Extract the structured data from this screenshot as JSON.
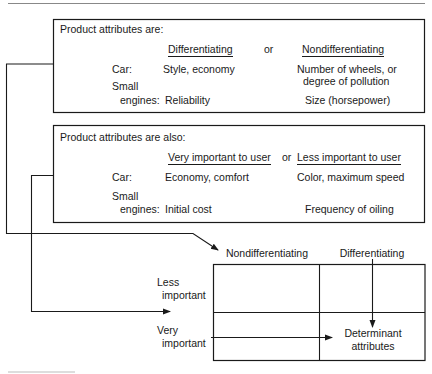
{
  "box1": {
    "title": "Product attributes are:",
    "col_left_header": "Differentiating",
    "connector": "or",
    "col_right_header": "Nondifferentiating",
    "rows": [
      {
        "label": "Car:",
        "left": "Style, economy",
        "right_line1": "Number of wheels, or",
        "right_line2": "degree of pollution"
      },
      {
        "label_line1": "Small",
        "label_line2": "engines:",
        "left": "Reliability",
        "right": "Size (horsepower)"
      }
    ]
  },
  "box2": {
    "title": "Product attributes are also:",
    "col_left_header": "Very important to user",
    "connector": "or",
    "col_right_header": "Less important to user",
    "rows": [
      {
        "label": "Car:",
        "left": "Economy, comfort",
        "right": "Color, maximum speed"
      },
      {
        "label_line1": "Small",
        "label_line2": "engines:",
        "left": "Initial cost",
        "right": "Frequency of oiling"
      }
    ]
  },
  "matrix": {
    "col_headers": [
      "Nondifferentiating",
      "Differentiating"
    ],
    "row_headers": [
      {
        "line1": "Less",
        "line2": "important"
      },
      {
        "line1": "Very",
        "line2": "important"
      }
    ],
    "cell_result_line1": "Determinant",
    "cell_result_line2": "attributes"
  },
  "colors": {
    "ink": "#1a1a1a",
    "background": "#ffffff",
    "rule": "#888888"
  }
}
